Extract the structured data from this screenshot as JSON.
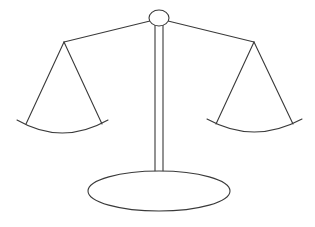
{
  "illustration": {
    "subject": "balance-scale",
    "colors": {
      "background": "#ffffff",
      "stroke": "#3a3a3a"
    },
    "knob": {
      "cx": 159,
      "cy": 18,
      "rx": 10,
      "ry": 8
    },
    "beam": {
      "left": {
        "x1": 64,
        "y1": 42,
        "x2": 150,
        "y2": 21
      },
      "right": {
        "x1": 168,
        "y1": 21,
        "x2": 254,
        "y2": 42
      }
    },
    "pillar": {
      "x_left": 155,
      "x_right": 163,
      "y_top": 25,
      "y_bottom": 172
    },
    "left_pan": {
      "pivot": [
        64,
        42
      ],
      "string_ends": [
        [
          26,
          124
        ],
        [
          102,
          124
        ]
      ],
      "arc": {
        "start": [
          17,
          120
        ],
        "control": [
          62,
          146
        ],
        "end": [
          108,
          120
        ]
      }
    },
    "right_pan": {
      "pivot": [
        254,
        42
      ],
      "string_ends": [
        [
          216,
          124
        ],
        [
          293,
          124
        ]
      ],
      "arc": {
        "start": [
          207,
          119
        ],
        "control": [
          254,
          145
        ],
        "end": [
          302,
          119
        ]
      }
    },
    "base": {
      "cx": 159,
      "cy": 191,
      "rx": 71,
      "ry": 20
    }
  }
}
